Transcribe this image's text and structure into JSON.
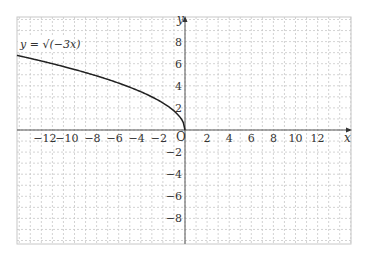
{
  "chart_data": {
    "type": "line",
    "title": "",
    "xlabel": "x",
    "ylabel": "y",
    "origin_label": "O",
    "annotation": "y = √(−3x)",
    "function": "y = sqrt(-3x)",
    "xlim": [
      -15.3,
      15
    ],
    "ylim": [
      -10.4,
      10.3
    ],
    "grid": true,
    "grid_style": "dashed",
    "x_ticks": [
      -12,
      -10,
      -8,
      -6,
      -4,
      -2,
      2,
      4,
      6,
      8,
      10,
      12
    ],
    "y_ticks": [
      8,
      6,
      4,
      2,
      -2,
      -4,
      -6,
      -8
    ],
    "series": [
      {
        "name": "y = √(−3x)",
        "x": [
          -15,
          -12,
          -10,
          -8,
          -6,
          -4,
          -3,
          -2,
          -1,
          -0.5,
          -0.1,
          0
        ],
        "y": [
          6.71,
          6.0,
          5.48,
          4.9,
          4.24,
          3.46,
          3.0,
          2.45,
          1.73,
          1.22,
          0.55,
          0
        ]
      }
    ],
    "colors": {
      "curve": "#222222",
      "axis": "#555555",
      "grid": "#c8c8c8"
    }
  }
}
